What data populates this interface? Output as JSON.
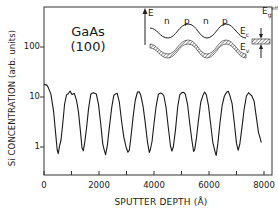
{
  "chart_data": {
    "type": "line",
    "title": "",
    "xlabel": "SPUTTER DEPTH (Å)",
    "ylabel": "Si CONCENTRATION (arb. units)",
    "xlim": [
      0,
      8000
    ],
    "ylim": [
      0.4,
      400
    ],
    "yscale": "log",
    "x_ticks": [
      0,
      2000,
      4000,
      6000,
      8000
    ],
    "x_tick_labels": [
      "0",
      "2000",
      "4000",
      "6000",
      "8000"
    ],
    "x_minor_ticks": [
      1000,
      3000,
      5000,
      7000
    ],
    "y_ticks": [
      1,
      10,
      100
    ],
    "y_tick_labels": [
      "1",
      "10",
      "100"
    ],
    "grid": false,
    "legend": null,
    "annotations": [
      {
        "text": "GaAs",
        "position": "upper-left"
      },
      {
        "text": "(100)",
        "position": "upper-left"
      }
    ],
    "inset": {
      "description": "band diagram of n-i-p-i doping superlattice",
      "axis_label": "E",
      "region_labels": [
        "n",
        "p",
        "n",
        "p"
      ],
      "band_labels": [
        "Ec",
        "Ev"
      ],
      "gap_label": "Eg eff"
    },
    "series": [
      {
        "name": "Si concentration",
        "x": [
          0,
          100,
          150,
          250,
          350,
          420,
          480,
          520,
          560,
          620,
          680,
          750,
          820,
          880,
          950,
          1020,
          1100,
          1180,
          1250,
          1320,
          1380,
          1430,
          1480,
          1550,
          1620,
          1700,
          1760,
          1820,
          1900,
          1980,
          2060,
          2140,
          2200,
          2240,
          2300,
          2380,
          2460,
          2540,
          2600,
          2660,
          2740,
          2820,
          2900,
          2980,
          3050,
          3100,
          3160,
          3240,
          3320,
          3400,
          3460,
          3520,
          3600,
          3680,
          3760,
          3830,
          3870,
          3930,
          4000,
          4080,
          4160,
          4240,
          4300,
          4360,
          4440,
          4520,
          4600,
          4650,
          4700,
          4780,
          4860,
          4940,
          5020,
          5080,
          5140,
          5220,
          5300,
          5380,
          5440,
          5480,
          5540,
          5620,
          5700,
          5780,
          5840,
          5900,
          5980,
          6060,
          6140,
          6220,
          6260,
          6320,
          6400,
          6480,
          6560,
          6640,
          6700,
          6760,
          6840,
          6920,
          7000,
          7060,
          7120,
          7200,
          7280,
          7360,
          7440,
          7500,
          7560,
          7640,
          7720,
          7800,
          7850,
          7900
        ],
        "values": [
          17,
          17,
          16,
          12,
          5,
          2,
          0.9,
          0.7,
          1.0,
          1.4,
          3,
          7,
          11,
          12,
          12.5,
          11,
          12,
          9,
          5,
          2.2,
          1.0,
          0.8,
          1.2,
          2.5,
          6,
          11,
          12,
          12.5,
          11,
          7,
          3,
          1.2,
          0.8,
          0.7,
          1.1,
          2.5,
          6,
          11,
          12,
          11.5,
          8,
          3.5,
          1.5,
          1.0,
          0.8,
          0.9,
          1.5,
          4,
          9,
          12,
          12.5,
          11,
          7,
          3,
          1.3,
          0.8,
          0.85,
          1.3,
          3,
          7,
          11,
          12,
          12,
          10,
          6,
          2.5,
          1.1,
          0.8,
          1.0,
          2.2,
          6,
          11,
          12.5,
          13,
          11,
          7,
          3,
          1.3,
          0.8,
          0.9,
          1.5,
          3.5,
          8,
          11,
          12,
          11,
          7,
          3,
          1.2,
          0.8,
          0.7,
          1.1,
          3,
          7,
          11,
          12,
          13,
          11,
          7,
          3,
          1.2,
          0.9,
          1.1,
          2.5,
          6,
          10,
          12,
          11.5,
          11,
          8,
          4,
          2,
          1.5,
          1.2
        ]
      }
    ]
  },
  "figure": {
    "sample_name": "GaAs",
    "sample_orientation": "(100)",
    "ylabel": "Si CONCENTRATION (arb. units)",
    "xlabel": "SPUTTER DEPTH (Å)",
    "y_tick_100": "100",
    "y_tick_10": "10",
    "y_tick_1": "1",
    "x_tick_0": "0",
    "x_tick_2000": "2000",
    "x_tick_4000": "4000",
    "x_tick_6000": "6000",
    "x_tick_8000": "8000",
    "inset_E": "E",
    "inset_n1": "n",
    "inset_p1": "p",
    "inset_n2": "n",
    "inset_p2": "p",
    "inset_Ec": "E",
    "inset_Ec_sub": "c",
    "inset_Ev": "E",
    "inset_Ev_sub": "v",
    "inset_Eg": "E",
    "inset_Eg_sub": "g",
    "inset_Eg_sup": "eff",
    "line_color": "#1a1a1a",
    "background": "#ffffff"
  }
}
